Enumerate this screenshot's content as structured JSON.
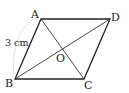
{
  "diagram": {
    "points": {
      "A": {
        "label": "A",
        "x": 41,
        "y": 19
      },
      "B": {
        "label": "B",
        "x": 15,
        "y": 79
      },
      "C": {
        "label": "C",
        "x": 84,
        "y": 79
      },
      "D": {
        "label": "D",
        "x": 110,
        "y": 19
      },
      "O": {
        "label": "O",
        "x": 62.5,
        "y": 49
      }
    },
    "measurement": {
      "segment": "AB",
      "label": "3 cm"
    },
    "colors": {
      "stroke": "#222222",
      "dotted": "#999999",
      "background": "#ffffff"
    }
  }
}
